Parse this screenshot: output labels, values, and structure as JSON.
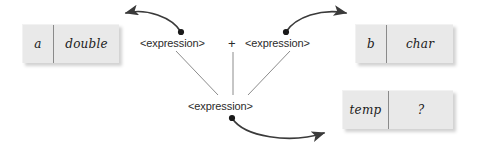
{
  "diagram": {
    "background_color": "#ffffff",
    "line_color": "#3a3a3a",
    "thin_line_color": "#8c8c8c",
    "box_fill_color": "#e9e9e9",
    "box_divider_color": "#8a8a8a",
    "text_color": "#1a1a1a",
    "boxes": [
      {
        "id": "a",
        "name": "a",
        "type": "double"
      },
      {
        "id": "b",
        "name": "b",
        "type": "char"
      },
      {
        "id": "temp",
        "name": "temp",
        "type": "?"
      }
    ],
    "labels": {
      "expr_left": "<expression>",
      "operator": "+",
      "expr_right": "<expression>",
      "expr_result": "<expression>"
    },
    "connectors": [
      {
        "id": "left-arrow",
        "from": "expr-left-dot",
        "to": "box-a",
        "style": "curved-arrow"
      },
      {
        "id": "right-arrow",
        "from": "expr-right-dot",
        "to": "box-b",
        "style": "curved-arrow"
      },
      {
        "id": "result-arrow",
        "from": "expr-result-dot",
        "to": "box-temp",
        "style": "curved-arrow"
      },
      {
        "id": "left-branch",
        "from": "expr-left",
        "to": "expr-result",
        "style": "thin-line"
      },
      {
        "id": "op-branch",
        "from": "operator",
        "to": "expr-result",
        "style": "thin-line"
      },
      {
        "id": "right-branch",
        "from": "expr-right",
        "to": "expr-result",
        "style": "thin-line"
      }
    ]
  }
}
